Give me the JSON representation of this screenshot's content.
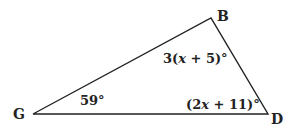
{
  "diagram": {
    "type": "triangle",
    "vertices": [
      {
        "name": "B",
        "x": 211,
        "y": 18
      },
      {
        "name": "G",
        "x": 33,
        "y": 114
      },
      {
        "name": "D",
        "x": 268,
        "y": 114
      }
    ],
    "labels": {
      "B": "B",
      "G": "G",
      "D": "D"
    },
    "angles": {
      "B": {
        "pre": "3(",
        "var": "x",
        "post": " + 5)°"
      },
      "G": {
        "text": "59°"
      },
      "D": {
        "pre": "(2",
        "var": "x",
        "post": " + 11)°"
      }
    },
    "stroke_color": "#222222"
  }
}
